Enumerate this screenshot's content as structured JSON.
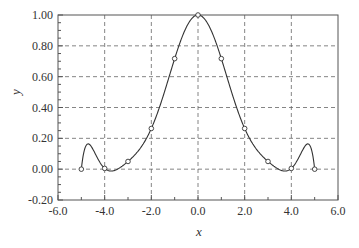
{
  "chart_data": {
    "type": "line",
    "title": "",
    "xlabel": "x",
    "ylabel": "y",
    "xlim": [
      -6.0,
      6.0
    ],
    "ylim": [
      -0.2,
      1.0
    ],
    "xticks": [
      -6.0,
      -4.0,
      -2.0,
      0.0,
      2.0,
      4.0,
      6.0
    ],
    "xtick_labels": [
      "-6.0",
      "-4.0",
      "-2.0",
      "0.0",
      "2.0",
      "4.0",
      "6.0"
    ],
    "yticks": [
      -0.2,
      0.0,
      0.2,
      0.4,
      0.6,
      0.8,
      1.0
    ],
    "ytick_labels": [
      "-0.20",
      "0.00",
      "0.20",
      "0.40",
      "0.60",
      "0.80",
      "1.00"
    ],
    "grid": true,
    "legend": null,
    "series": [
      {
        "name": "interpolation-nodes",
        "style": "markers",
        "x": [
          -5,
          -4,
          -3,
          -2,
          -1,
          0,
          1,
          2,
          3,
          4,
          5
        ],
        "y": [
          0.0,
          0.005,
          0.05,
          0.264,
          0.717,
          1.0,
          0.717,
          0.264,
          0.05,
          0.005,
          0.0
        ]
      },
      {
        "name": "interpolating-polynomial",
        "style": "line",
        "x_range": [
          -5,
          5
        ],
        "approx_points": [
          [
            -5,
            0.0
          ],
          [
            -4.6,
            0.16
          ],
          [
            -4,
            0.005
          ],
          [
            -3.7,
            -0.01
          ],
          [
            -3,
            0.05
          ],
          [
            -2,
            0.264
          ],
          [
            -1,
            0.717
          ],
          [
            0,
            1.0
          ],
          [
            1,
            0.717
          ],
          [
            2,
            0.264
          ],
          [
            3,
            0.05
          ],
          [
            3.7,
            -0.01
          ],
          [
            4,
            0.005
          ],
          [
            4.6,
            0.16
          ],
          [
            5,
            0.0
          ]
        ]
      }
    ]
  },
  "colors": {
    "axis": "#555555",
    "grid": "#666666",
    "line": "#333333",
    "marker_fill": "#ffffff"
  }
}
